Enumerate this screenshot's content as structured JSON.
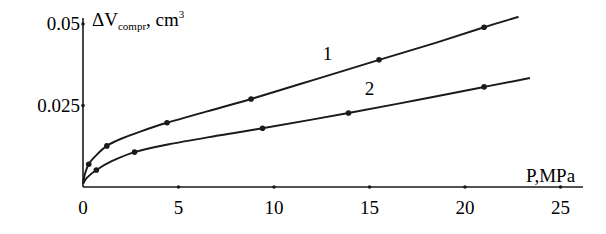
{
  "chart_data": {
    "type": "line",
    "title": "",
    "xlabel": "P,MPa",
    "ylabel": "ΔV_compr, cm³",
    "ylabel_parts": {
      "main": "ΔV",
      "subscript": "compr",
      "rest": ", cm",
      "superscript": "3"
    },
    "xlim": [
      0,
      25
    ],
    "ylim": [
      0,
      0.05
    ],
    "x_ticks": [
      0,
      5,
      10,
      15,
      20,
      25
    ],
    "x_tick_labels": [
      "0",
      "5",
      "10",
      "15",
      "20",
      "25"
    ],
    "y_ticks": [
      0.025,
      0.05
    ],
    "y_tick_labels": [
      "0.025",
      "0.05"
    ],
    "grid": false,
    "legend": "inline numeric labels on curves",
    "series": [
      {
        "name": "1",
        "label_position": {
          "x": 12.8,
          "y": 0.039
        },
        "points": [
          {
            "x": 0.3,
            "y": 0.007
          },
          {
            "x": 1.25,
            "y": 0.0126
          },
          {
            "x": 4.4,
            "y": 0.0197
          },
          {
            "x": 8.8,
            "y": 0.027
          },
          {
            "x": 15.5,
            "y": 0.039
          },
          {
            "x": 21.0,
            "y": 0.049
          }
        ],
        "curve": [
          [
            0,
            0.001
          ],
          [
            0.1,
            0.004
          ],
          [
            0.3,
            0.007
          ],
          [
            0.7,
            0.0098
          ],
          [
            1.25,
            0.0126
          ],
          [
            2,
            0.0148
          ],
          [
            3,
            0.017
          ],
          [
            4.4,
            0.0197
          ],
          [
            6.5,
            0.0232
          ],
          [
            8.8,
            0.027
          ],
          [
            12,
            0.0327
          ],
          [
            15.5,
            0.039
          ],
          [
            18.5,
            0.0443
          ],
          [
            21.0,
            0.049
          ],
          [
            22.8,
            0.0522
          ]
        ]
      },
      {
        "name": "2",
        "label_position": {
          "x": 15.0,
          "y": 0.0283
        },
        "points": [
          {
            "x": 0.7,
            "y": 0.0052
          },
          {
            "x": 2.7,
            "y": 0.0107
          },
          {
            "x": 9.4,
            "y": 0.018
          },
          {
            "x": 13.9,
            "y": 0.0227
          },
          {
            "x": 21.0,
            "y": 0.0307
          }
        ],
        "curve": [
          [
            0,
            0.001
          ],
          [
            0.2,
            0.0028
          ],
          [
            0.7,
            0.0052
          ],
          [
            1.5,
            0.0079
          ],
          [
            2.7,
            0.0107
          ],
          [
            4.5,
            0.0131
          ],
          [
            7,
            0.0157
          ],
          [
            9.4,
            0.018
          ],
          [
            13.9,
            0.0227
          ],
          [
            17.5,
            0.0267
          ],
          [
            21.0,
            0.0307
          ],
          [
            23.4,
            0.0334
          ]
        ]
      }
    ]
  },
  "layout": {
    "origin_px": [
      83,
      187
    ],
    "px_per_x": 19.1,
    "px_per_y": 3260,
    "x_axis_end_px": 583,
    "y_axis_top_px": 18,
    "line_color": "#1a1a1a"
  }
}
